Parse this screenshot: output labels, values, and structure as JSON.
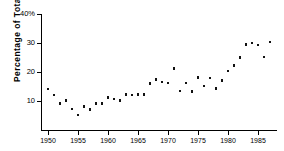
{
  "chart_data": {
    "type": "scatter",
    "title": "",
    "xlabel": "",
    "ylabel": "Percentage of Total Number",
    "xlim": [
      1949,
      1988
    ],
    "ylim": [
      0,
      40
    ],
    "xticks": [
      1950,
      1955,
      1960,
      1965,
      1970,
      1975,
      1980,
      1985
    ],
    "xticklabels": [
      "1950",
      "1955",
      "1960",
      "1965",
      "1970",
      "1975",
      "1980",
      "1985"
    ],
    "yticks": [
      10,
      20,
      30,
      40
    ],
    "yticklabels": [
      "10",
      "20",
      "30",
      "40%"
    ],
    "grid": false,
    "legend": null,
    "marker": "square",
    "marker_color": "#111111",
    "x": [
      1950,
      1951,
      1952,
      1953,
      1954,
      1955,
      1956,
      1957,
      1958,
      1959,
      1960,
      1961,
      1962,
      1963,
      1964,
      1965,
      1966,
      1967,
      1968,
      1969,
      1970,
      1971,
      1972,
      1973,
      1974,
      1975,
      1976,
      1977,
      1978,
      1979,
      1980,
      1981,
      1982,
      1983,
      1984,
      1985,
      1986,
      1987
    ],
    "y": [
      14.2,
      12.1,
      9.1,
      10.1,
      7.2,
      5.2,
      8.1,
      7.0,
      9.2,
      9.1,
      11.2,
      10.7,
      10.2,
      12.2,
      12.1,
      12.2,
      12.3,
      16.0,
      17.5,
      16.5,
      16.2,
      21.2,
      13.4,
      16.2,
      13.3,
      18.1,
      15.2,
      18.0,
      14.3,
      17.0,
      20.4,
      22.2,
      25.1,
      29.4,
      30.0,
      29.3,
      25.2,
      30.4
    ]
  },
  "axes": {
    "top_tick_label": "40%"
  }
}
